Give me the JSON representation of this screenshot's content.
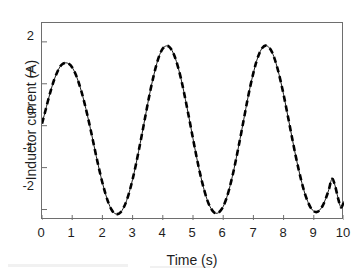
{
  "chart_data": {
    "type": "line",
    "title": "",
    "xlabel": "Time (s)",
    "ylabel": "Inductor current (A)",
    "xlim": [
      0,
      10
    ],
    "ylim": [
      -2.25,
      2.45
    ],
    "xticks": [
      0,
      1,
      2,
      3,
      4,
      5,
      6,
      7,
      8,
      9,
      10
    ],
    "xtick_labels": [
      "0",
      "1",
      "2",
      "3",
      "4",
      "5",
      "6",
      "7",
      "8",
      "9",
      "10"
    ],
    "yticks": [
      -2,
      -1,
      0,
      1,
      2
    ],
    "ytick_labels": [
      "-2",
      "-1",
      "0",
      "1",
      "2"
    ],
    "grid": false,
    "legend": null,
    "series": [
      {
        "name": "Inductor current",
        "style": "dashed-over-solid",
        "color": "#000000",
        "linewidth": 2.6,
        "dash": "6 4",
        "x": [
          0.0,
          0.1,
          0.2,
          0.3,
          0.4,
          0.5,
          0.6,
          0.7,
          0.8,
          0.9,
          1.0,
          1.1,
          1.2,
          1.3,
          1.4,
          1.5,
          1.6,
          1.7,
          1.8,
          1.9,
          2.0,
          2.1,
          2.2,
          2.3,
          2.4,
          2.5,
          2.6,
          2.7,
          2.8,
          2.9,
          3.0,
          3.1,
          3.2,
          3.3,
          3.4,
          3.5,
          3.6,
          3.7,
          3.8,
          3.9,
          4.0,
          4.1,
          4.2,
          4.3,
          4.4,
          4.5,
          4.6,
          4.7,
          4.8,
          4.9,
          5.0,
          5.1,
          5.2,
          5.3,
          5.4,
          5.5,
          5.6,
          5.7,
          5.8,
          5.9,
          6.0,
          6.1,
          6.2,
          6.3,
          6.4,
          6.5,
          6.6,
          6.7,
          6.8,
          6.9,
          7.0,
          7.1,
          7.2,
          7.3,
          7.4,
          7.5,
          7.6,
          7.7,
          7.8,
          7.9,
          8.0,
          8.1,
          8.2,
          8.3,
          8.4,
          8.5,
          8.6,
          8.7,
          8.8,
          8.9,
          9.0,
          9.1,
          9.2,
          9.3,
          9.4,
          9.5,
          9.6,
          9.7,
          9.8,
          9.9,
          10.0
        ],
        "y": [
          0.05,
          0.32,
          0.6,
          0.86,
          1.09,
          1.27,
          1.41,
          1.48,
          1.5,
          1.47,
          1.39,
          1.25,
          1.06,
          0.83,
          0.56,
          0.26,
          -0.06,
          -0.4,
          -0.74,
          -1.06,
          -1.36,
          -1.62,
          -1.84,
          -2.0,
          -2.09,
          -2.11,
          -2.07,
          -1.96,
          -1.79,
          -1.56,
          -1.28,
          -0.96,
          -0.61,
          -0.24,
          0.14,
          0.52,
          0.88,
          1.2,
          1.48,
          1.7,
          1.84,
          1.9,
          1.89,
          1.8,
          1.64,
          1.41,
          1.13,
          0.8,
          0.44,
          0.07,
          -0.31,
          -0.68,
          -1.03,
          -1.34,
          -1.61,
          -1.83,
          -1.98,
          -2.07,
          -2.09,
          -2.04,
          -1.93,
          -1.75,
          -1.51,
          -1.22,
          -0.89,
          -0.53,
          -0.16,
          0.22,
          0.6,
          0.95,
          1.26,
          1.53,
          1.73,
          1.86,
          1.91,
          1.88,
          1.78,
          1.6,
          1.36,
          1.07,
          0.74,
          0.38,
          0.01,
          -0.36,
          -0.72,
          -1.05,
          -1.35,
          -1.61,
          -1.81,
          -1.96,
          -2.04,
          -2.06,
          -2.01,
          -1.9,
          -1.73,
          -1.52,
          -1.27,
          -1.42,
          -1.72,
          -1.95,
          -1.8
        ]
      }
    ],
    "annotations": []
  },
  "axes": {
    "x_title": "Time (s)",
    "y_title": "Inductor current (A)"
  }
}
